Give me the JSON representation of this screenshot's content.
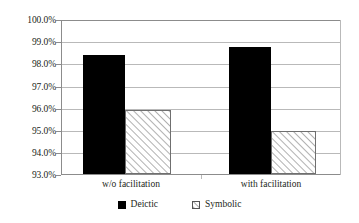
{
  "chart_data": {
    "type": "bar",
    "title": "",
    "subtitle": "",
    "xlabel": "",
    "ylabel": "",
    "categories": [
      "w/o facilitation",
      "with facilitation"
    ],
    "series": [
      {
        "name": "Deictic",
        "values": [
          98.4,
          98.75
        ]
      },
      {
        "name": "Symbolic",
        "values": [
          95.9,
          94.95
        ]
      }
    ],
    "ylim": [
      93.0,
      100.0
    ],
    "yticks": [
      "93.0%",
      "94.0%",
      "95.0%",
      "96.0%",
      "97.0%",
      "98.0%",
      "99.0%",
      "100.0%"
    ],
    "ytick_values": [
      93.0,
      94.0,
      95.0,
      96.0,
      97.0,
      98.0,
      99.0,
      100.0
    ],
    "grid": true,
    "legend_position": "bottom",
    "colors": {
      "deictic": "#000000",
      "symbolic_fill": "#ffffff",
      "symbolic_hatch": "#6f6f6f",
      "gridline": "#b9b9b9",
      "axis": "#8c8c8c",
      "text": "#231f20",
      "background": "#ffffff"
    }
  },
  "legend": {
    "items": [
      {
        "label": "Deictic",
        "marker": "solid-square-icon"
      },
      {
        "label": "Symbolic",
        "marker": "hatched-square-icon"
      }
    ]
  }
}
